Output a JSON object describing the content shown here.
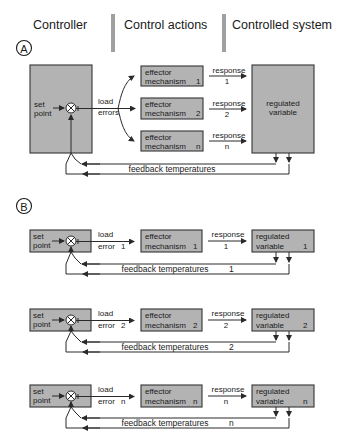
{
  "header": {
    "columns": [
      "Controller",
      "Control actions",
      "Controlled system"
    ]
  },
  "panel_a": {
    "marker": "A",
    "controller": {
      "set_point": [
        "set",
        "point"
      ]
    },
    "load_errors": [
      "load",
      "errors"
    ],
    "effectors": [
      {
        "line1": "effector",
        "line2": "mechanism",
        "index": "1",
        "response": "response",
        "response_index": "1"
      },
      {
        "line1": "effector",
        "line2": "mechanism",
        "index": "2",
        "response": "response",
        "response_index": "2"
      },
      {
        "line1": "effector",
        "line2": "mechanism",
        "index": "n",
        "response": "response",
        "response_index": "n"
      }
    ],
    "regulated": [
      "regulated",
      "variable"
    ],
    "feedback_label": "feedback temperatures"
  },
  "panel_b": {
    "marker": "B",
    "rows": [
      {
        "set_point": [
          "set",
          "point"
        ],
        "load": "load",
        "error": "error",
        "index": "1",
        "effector": [
          "effector",
          "mechanism"
        ],
        "response": "response",
        "regulated": [
          "regulated",
          "variable"
        ],
        "feedback": "feedback temperatures"
      },
      {
        "set_point": [
          "set",
          "point"
        ],
        "load": "load",
        "error": "error",
        "index": "2",
        "effector": [
          "effector",
          "mechanism"
        ],
        "response": "response",
        "regulated": [
          "regulated",
          "variable"
        ],
        "feedback": "feedback temperatures"
      },
      {
        "set_point": [
          "set",
          "point"
        ],
        "load": "load",
        "error": "error",
        "index": "n",
        "effector": [
          "effector",
          "mechanism"
        ],
        "response": "response",
        "regulated": [
          "regulated",
          "variable"
        ],
        "feedback": "feedback temperatures"
      }
    ]
  },
  "colors": {
    "box_fill": "#b3b3b3",
    "line": "#2a2a2a"
  }
}
